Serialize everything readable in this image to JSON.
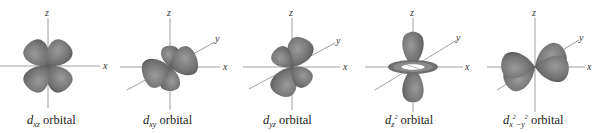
{
  "figure": {
    "lobe_color": "#6e6e6e",
    "lobe_highlight": "#9a9a9a",
    "axis_color": "#888888",
    "panels": [
      {
        "id": "dxz",
        "axes": [
          "z",
          "x"
        ],
        "caption_prefix": "d",
        "caption_sub": "xz",
        "caption_suffix": " orbital"
      },
      {
        "id": "dxy",
        "axes": [
          "z",
          "y",
          "x"
        ],
        "caption_prefix": "d",
        "caption_sub": "xy",
        "caption_suffix": " orbital"
      },
      {
        "id": "dyz",
        "axes": [
          "z",
          "y",
          "x"
        ],
        "caption_prefix": "d",
        "caption_sub": "yz",
        "caption_suffix": " orbital"
      },
      {
        "id": "dz2",
        "axes": [
          "z",
          "y",
          "x"
        ],
        "caption_prefix": "d",
        "caption_sub": "z",
        "caption_sup": "2",
        "caption_suffix": " orbital"
      },
      {
        "id": "dx2y2",
        "axes": [
          "z",
          "y",
          "x"
        ],
        "caption_prefix": "d",
        "caption_sub": "x",
        "caption_sup": "2",
        "caption_mid": "−y",
        "caption_sup2": "2",
        "caption_suffix": " orbital"
      }
    ]
  }
}
